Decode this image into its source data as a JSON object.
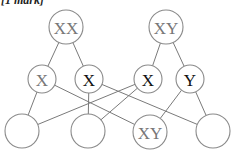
{
  "header": {
    "mark_text": "[1 mark]"
  },
  "diagram": {
    "top_row": [
      {
        "id": "p1",
        "label": "XX",
        "x": 66,
        "y": 27,
        "r": 17,
        "color": "#777777"
      },
      {
        "id": "p2",
        "label": "XY",
        "x": 166,
        "y": 27,
        "r": 17,
        "color": "#777777"
      }
    ],
    "middle_row": [
      {
        "id": "g1",
        "label": "X",
        "x": 42,
        "y": 79,
        "r": 14,
        "color": "#777777"
      },
      {
        "id": "g2",
        "label": "X",
        "x": 89,
        "y": 79,
        "r": 14,
        "color": "#111111"
      },
      {
        "id": "g3",
        "label": "X",
        "x": 148,
        "y": 79,
        "r": 14,
        "color": "#111111"
      },
      {
        "id": "g4",
        "label": "Y",
        "x": 190,
        "y": 79,
        "r": 14,
        "color": "#111111"
      }
    ],
    "bottom_row": [
      {
        "id": "c1",
        "label": "",
        "x": 22,
        "y": 131,
        "r": 17,
        "color": "#777777"
      },
      {
        "id": "c2",
        "label": "",
        "x": 88,
        "y": 131,
        "r": 17,
        "color": "#777777"
      },
      {
        "id": "c3",
        "label": "XY",
        "x": 150,
        "y": 132,
        "r": 17,
        "color": "#777777"
      },
      {
        "id": "c4",
        "label": "",
        "x": 213,
        "y": 131,
        "r": 17,
        "color": "#777777"
      }
    ],
    "edges": [
      [
        "p1",
        "g1"
      ],
      [
        "p1",
        "g2"
      ],
      [
        "p2",
        "g3"
      ],
      [
        "p2",
        "g4"
      ],
      [
        "g1",
        "c1"
      ],
      [
        "g1",
        "c3"
      ],
      [
        "g2",
        "c2"
      ],
      [
        "g2",
        "c4"
      ],
      [
        "g3",
        "c1"
      ],
      [
        "g3",
        "c2"
      ],
      [
        "g4",
        "c3"
      ],
      [
        "g4",
        "c4"
      ]
    ]
  }
}
